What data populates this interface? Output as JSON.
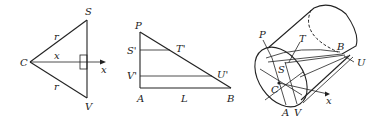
{
  "figures": {
    "cross_section": {
      "labels": {
        "C": "C",
        "S": "S",
        "V": "V",
        "r_top": "r",
        "r_bottom": "r",
        "x_mid": "x",
        "x_axis": "x"
      }
    },
    "side_triangle": {
      "labels": {
        "P": "P",
        "S_prime": "S'",
        "T_prime": "T'",
        "V_prime": "V'",
        "U_prime": "U'",
        "A": "A",
        "L": "L",
        "B": "B"
      }
    },
    "cylinder_wedge": {
      "labels": {
        "P": "P",
        "T": "T",
        "B": "B",
        "U": "U",
        "S": "S",
        "C": "C",
        "A": "A",
        "V": "V",
        "x": "x"
      }
    }
  }
}
